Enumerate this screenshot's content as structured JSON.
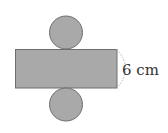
{
  "diagram": {
    "type": "cylinder-net",
    "height_label": "6 cm",
    "colors": {
      "fill": "#a9a9a9",
      "stroke": "#6e6e6e",
      "dash": "#b5b5b5",
      "text": "#333333"
    }
  }
}
